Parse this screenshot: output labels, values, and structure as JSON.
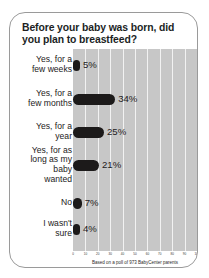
{
  "card": {
    "title": "Before your baby was born, did you plan to breastfeed?",
    "footnote": "Based on a poll of 973 BabyCenter parents"
  },
  "chart_data": {
    "type": "bar",
    "orientation": "horizontal",
    "title": "Before your baby was born, did you plan to breastfeed?",
    "xlabel": "",
    "ylabel": "",
    "xlim": [
      0,
      100
    ],
    "grid": true,
    "legend": false,
    "footnote": "Based on a poll of 973 BabyCenter parents",
    "categories": [
      "Yes, for a\nfew weeks",
      "Yes, for a\nfew months",
      "Yes, for a\nyear",
      "Yes, for as\nlong as my\nbaby\nwanted",
      "No",
      "I wasn't\nsure"
    ],
    "values": [
      5,
      34,
      25,
      21,
      7,
      4
    ],
    "value_labels": [
      "5%",
      "34%",
      "25%",
      "21%",
      "7%",
      "4%"
    ],
    "xticks": [
      0,
      10,
      20,
      30,
      40,
      50,
      60,
      70,
      80,
      90,
      100
    ],
    "xtick_labels": [
      "0",
      "10",
      "20",
      "30",
      "40",
      "50",
      "60",
      "70",
      "80",
      "90",
      "100"
    ],
    "colors": {
      "bar": "#1c1a1a",
      "plot_background": "#c7c7c7",
      "gridline": "#f2f2f2",
      "card_border": "#9a9a9a",
      "text": "#1d1b1b",
      "page_background": "#ffffff"
    }
  }
}
